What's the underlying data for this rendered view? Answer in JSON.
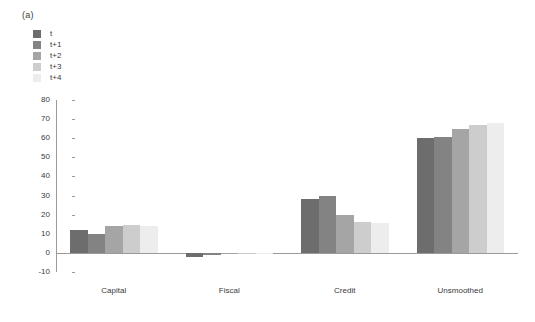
{
  "figure": {
    "panel_label": "(a)",
    "background": "#ffffff",
    "text_color": "#3a3a3a"
  },
  "legend": {
    "position": "top-left",
    "entries": [
      {
        "label": "t",
        "color": "#6d6d6d"
      },
      {
        "label": "t+1",
        "color": "#838383"
      },
      {
        "label": "t+2",
        "color": "#a5a5a5"
      },
      {
        "label": "t+3",
        "color": "#cdcdcd"
      },
      {
        "label": "t+4",
        "color": "#ededed"
      }
    ]
  },
  "axis": {
    "y_ticks": [
      "80",
      "70",
      "60",
      "50",
      "40",
      "30",
      "20",
      "10",
      "0",
      "-10"
    ],
    "y_tick_values": [
      80,
      70,
      60,
      50,
      40,
      30,
      20,
      10,
      0,
      -10
    ],
    "y_min": -10,
    "y_max": 80,
    "axis_color": "#9a9a9a"
  },
  "chart_data": {
    "type": "bar",
    "title": "",
    "xlabel": "",
    "ylabel": "",
    "ylim": [
      -10,
      80
    ],
    "grid": false,
    "legend_position": "top-left",
    "categories": [
      "Capital",
      "Fiscal",
      "Credit",
      "Unsmoothed"
    ],
    "series": [
      {
        "name": "t",
        "color": "#6d6d6d",
        "values": [
          12.0,
          -2.2,
          28.0,
          60.3
        ]
      },
      {
        "name": "t+1",
        "color": "#838383",
        "values": [
          10.0,
          -1.2,
          30.0,
          60.8
        ]
      },
      {
        "name": "t+2",
        "color": "#a5a5a5",
        "values": [
          14.0,
          -0.4,
          20.0,
          64.8
        ]
      },
      {
        "name": "t+3",
        "color": "#cdcdcd",
        "values": [
          14.8,
          -0.2,
          16.2,
          67.0
        ]
      },
      {
        "name": "t+4",
        "color": "#ededed",
        "values": [
          14.0,
          -0.1,
          15.5,
          67.8
        ]
      }
    ]
  }
}
